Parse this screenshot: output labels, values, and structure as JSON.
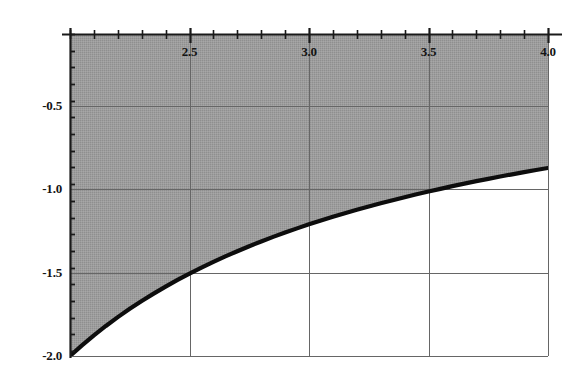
{
  "figure": {
    "width": 581,
    "height": 381,
    "background_color": "#ffffff",
    "axis_color": "#1a1a1a",
    "grid_color": "#666666",
    "fill_color": "#9a9a9a",
    "curve_color": "#0d0d0d"
  },
  "chart_data": {
    "type": "line",
    "title": "",
    "subtitle": "",
    "xlabel": "",
    "ylabel": "",
    "xlim": [
      2.0,
      4.0
    ],
    "ylim": [
      -2.0,
      -0.07
    ],
    "grid": true,
    "legend": null,
    "legend_position": "none",
    "xticks": [
      2.5,
      3.0,
      3.5,
      4.0
    ],
    "xtick_labels": [
      "2.5",
      "3.0",
      "3.5",
      "4.0"
    ],
    "yticks": [
      -0.5,
      -1.0,
      -1.5,
      -2.0
    ],
    "ytick_labels": [
      "-0.5",
      "-1.0",
      "-1.5",
      "-2.0"
    ],
    "x_minor_tick_step": 0.1,
    "y_minor_tick_step": 0.1,
    "shaded_region": {
      "label": "region above curve",
      "fill_color": "#9a9a9a",
      "bounded_below_by": "curve",
      "bounded_above_by": "top axis"
    },
    "series": [
      {
        "name": "curve",
        "color": "#0d0d0d",
        "line_width": 4,
        "x": [
          2.0,
          2.05,
          2.1,
          2.15,
          2.2,
          2.25,
          2.3,
          2.35,
          2.4,
          2.45,
          2.5,
          2.55,
          2.6,
          2.65,
          2.7,
          2.75,
          2.8,
          2.85,
          2.9,
          2.95,
          3.0,
          3.05,
          3.1,
          3.15,
          3.2,
          3.25,
          3.3,
          3.35,
          3.4,
          3.45,
          3.5,
          3.55,
          3.6,
          3.65,
          3.7,
          3.75,
          3.8,
          3.85,
          3.9,
          3.95,
          4.0
        ],
        "y": [
          -2.0,
          -1.936,
          -1.876,
          -1.82,
          -1.767,
          -1.717,
          -1.67,
          -1.626,
          -1.584,
          -1.544,
          -1.506,
          -1.47,
          -1.436,
          -1.403,
          -1.372,
          -1.342,
          -1.314,
          -1.286,
          -1.26,
          -1.235,
          -1.211,
          -1.188,
          -1.166,
          -1.144,
          -1.124,
          -1.104,
          -1.085,
          -1.066,
          -1.048,
          -1.031,
          -1.014,
          -0.998,
          -0.982,
          -0.967,
          -0.952,
          -0.938,
          -0.924,
          -0.911,
          -0.898,
          -0.885,
          -0.873
        ]
      }
    ],
    "annotations": []
  }
}
